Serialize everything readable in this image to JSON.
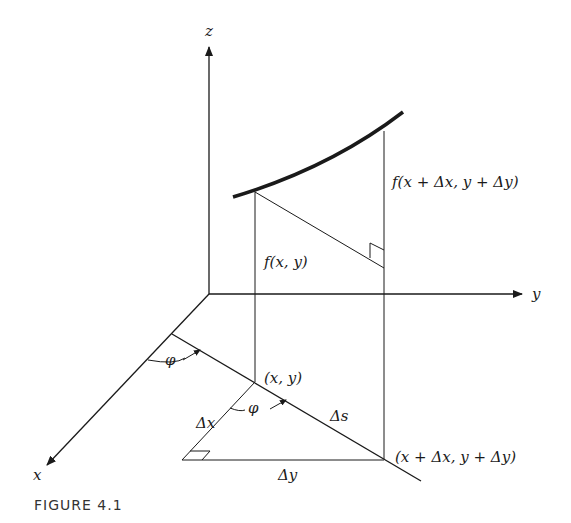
{
  "figure": {
    "caption": "FIGURE 4.1",
    "axes": {
      "x_label": "x",
      "y_label": "y",
      "z_label": "z"
    },
    "labels": {
      "f_xy": "f(x, y)",
      "f_shifted": "f(x + Δx, y + Δy)",
      "point_xy": "(x, y)",
      "point_shifted": "(x + Δx, y + Δy)",
      "delta_x": "Δx",
      "delta_y": "Δy",
      "delta_s": "Δs",
      "phi_1": "φ",
      "phi_2": "φ"
    },
    "colors": {
      "line": "#1a1a1a",
      "background": "#ffffff"
    }
  }
}
